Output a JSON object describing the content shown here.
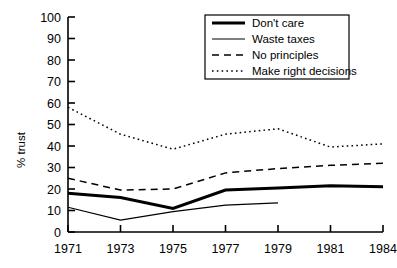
{
  "chart_data": {
    "type": "line",
    "title": "",
    "xlabel": "",
    "ylabel": "% trust",
    "categories": [
      "1971",
      "1973",
      "1975",
      "1977",
      "1979",
      "1981",
      "1984"
    ],
    "ylim": [
      0,
      100
    ],
    "yticks": [
      0,
      10,
      20,
      30,
      40,
      50,
      60,
      70,
      80,
      90,
      100
    ],
    "ytick_labels": [
      "0",
      "10",
      "20",
      "30",
      "40",
      "50",
      "60",
      "70",
      "80",
      "90",
      "100"
    ],
    "grid": false,
    "legend_position": "upper-right",
    "series": [
      {
        "name": "Don't care",
        "style": "solid-thick",
        "color": "#000000",
        "values": [
          18,
          16,
          11,
          19.5,
          20.5,
          21.5,
          21
        ]
      },
      {
        "name": "Waste taxes",
        "style": "solid-thin",
        "color": "#000000",
        "values": [
          11.5,
          5.5,
          9.5,
          12.5,
          13.5,
          null,
          null
        ]
      },
      {
        "name": "No principles",
        "style": "dashed",
        "color": "#000000",
        "values": [
          25,
          19.5,
          20,
          27.5,
          29.5,
          31,
          32
        ]
      },
      {
        "name": "Make right decisions",
        "style": "dotted",
        "color": "#000000",
        "values": [
          58,
          45.5,
          38.5,
          45.5,
          48,
          39.5,
          41
        ]
      }
    ]
  },
  "legend": {
    "items": [
      {
        "label": "Don't care"
      },
      {
        "label": "Waste taxes"
      },
      {
        "label": "No principles"
      },
      {
        "label": "Make right decisions"
      }
    ]
  },
  "axes": {
    "y_title": "% trust"
  }
}
